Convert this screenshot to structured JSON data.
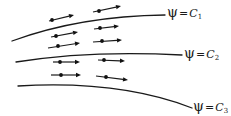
{
  "diagram": {
    "colors": {
      "stroke": "#1a1a1a",
      "background": "#ffffff"
    },
    "streamlines": [
      {
        "id": 1,
        "symbol": "ψ",
        "equals": "=",
        "constant": "C",
        "subscript": "1",
        "path": "M12,41 Q80,16 165,15",
        "label_pos": [
          167,
          5
        ]
      },
      {
        "id": 2,
        "symbol": "ψ",
        "equals": "=",
        "constant": "C",
        "subscript": "2",
        "path": "M16,62 Q90,50 182,55",
        "label_pos": [
          184,
          46
        ]
      },
      {
        "id": 3,
        "symbol": "ψ",
        "equals": "=",
        "constant": "C",
        "subscript": "3",
        "path": "M18,86 Q120,80 192,108",
        "label_pos": [
          193,
          99
        ]
      }
    ],
    "velocity_vectors": [
      {
        "tail": [
          49,
          21
        ],
        "dot": [
          52,
          20
        ],
        "tip": [
          74,
          15
        ]
      },
      {
        "tail": [
          93,
          12
        ],
        "dot": [
          99,
          11
        ],
        "tip": [
          121,
          6
        ]
      },
      {
        "tail": [
          51,
          37
        ],
        "dot": [
          56,
          36
        ],
        "tip": [
          78,
          32
        ]
      },
      {
        "tail": [
          94,
          29
        ],
        "dot": [
          100,
          28
        ],
        "tip": [
          119,
          26
        ]
      },
      {
        "tail": [
          48,
          48
        ],
        "dot": [
          58,
          46
        ],
        "tip": [
          80,
          43
        ]
      },
      {
        "tail": [
          93,
          42
        ],
        "dot": [
          102,
          41
        ],
        "tip": [
          122,
          40
        ]
      },
      {
        "tail": [
          53,
          62
        ],
        "dot": [
          60,
          62
        ],
        "tip": [
          80,
          62
        ]
      },
      {
        "tail": [
          98,
          60
        ],
        "dot": [
          104,
          60
        ],
        "tip": [
          125,
          61
        ]
      },
      {
        "tail": [
          51,
          75
        ],
        "dot": [
          61,
          75
        ],
        "tip": [
          81,
          75
        ]
      },
      {
        "tail": [
          96,
          76
        ],
        "dot": [
          106,
          77
        ],
        "tip": [
          128,
          80
        ]
      }
    ]
  }
}
